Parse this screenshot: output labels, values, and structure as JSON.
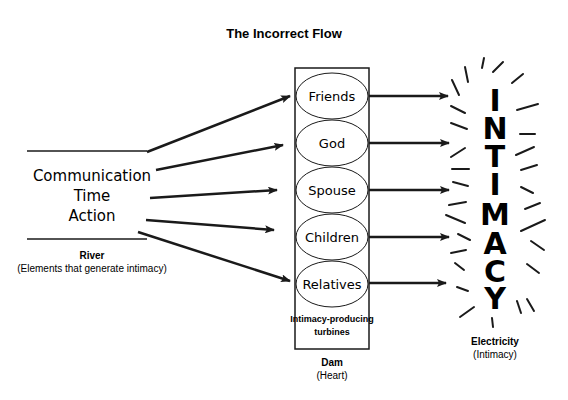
{
  "title": "The Incorrect Flow",
  "river": {
    "elements": [
      "Communication",
      "Time",
      "Action"
    ],
    "label": "River",
    "sublabel": "(Elements that generate intimacy)"
  },
  "dam": {
    "turbines": [
      "Friends",
      "God",
      "Spouse",
      "Children",
      "Relatives"
    ],
    "caption_line1": "Intimacy-producing",
    "caption_line2": "turbines",
    "label": "Dam",
    "sublabel": "(Heart)"
  },
  "output": {
    "letters": [
      "I",
      "N",
      "T",
      "I",
      "M",
      "A",
      "C",
      "Y"
    ],
    "word": "INTIMACY",
    "label": "Electricity",
    "sublabel": "(Intimacy)"
  },
  "colors": {
    "ink": "#1a1a1a",
    "background": "#ffffff"
  }
}
